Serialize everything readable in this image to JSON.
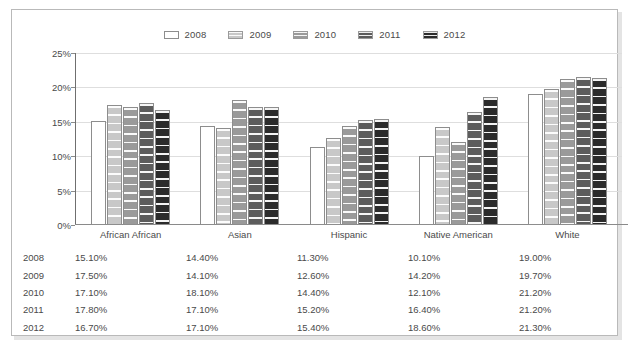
{
  "chart_data": {
    "type": "bar",
    "title": "",
    "subtitle": "",
    "xlabel": "",
    "ylabel": "",
    "ylim": [
      0,
      25
    ],
    "ytick_labels": [
      "0%",
      "5%",
      "10%",
      "15%",
      "20%",
      "25%"
    ],
    "ytick_values": [
      0,
      5,
      10,
      15,
      20,
      25
    ],
    "grid": true,
    "legend_position": "top-center",
    "value_suffix": "%",
    "categories": [
      "African African",
      "Asian",
      "Hispanic",
      "Native American",
      "White"
    ],
    "series": [
      {
        "name": "2008",
        "color": "#ffffff",
        "values": [
          15.1,
          14.4,
          11.3,
          10.1,
          19.0
        ]
      },
      {
        "name": "2009",
        "color": "#c8c8c8",
        "values": [
          17.5,
          14.1,
          12.6,
          14.2,
          19.7
        ]
      },
      {
        "name": "2010",
        "color": "#9a9a9a",
        "values": [
          17.1,
          18.1,
          14.4,
          12.1,
          21.2
        ]
      },
      {
        "name": "2011",
        "color": "#5c5c5c",
        "values": [
          17.8,
          17.1,
          15.2,
          16.4,
          21.5
        ]
      },
      {
        "name": "2012",
        "color": "#2b2b2b",
        "values": [
          16.7,
          17.1,
          15.4,
          18.6,
          21.3
        ]
      }
    ]
  },
  "legend": {
    "items": [
      {
        "label": "2008"
      },
      {
        "label": "2009"
      },
      {
        "label": "2010"
      },
      {
        "label": "2011"
      },
      {
        "label": "2012"
      }
    ]
  },
  "table": {
    "row_labels": [
      "2008",
      "2009",
      "2010",
      "2011",
      "2012"
    ],
    "column_headers": [
      "",
      "African African",
      "Asian",
      "Hispanic",
      "Native American",
      "White"
    ],
    "rows": [
      {
        "year": "2008",
        "values": [
          "15.10%",
          "14.40%",
          "11.30%",
          "10.10%",
          "19.00%"
        ]
      },
      {
        "year": "2009",
        "values": [
          "17.50%",
          "14.10%",
          "12.60%",
          "14.20%",
          "19.70%"
        ]
      },
      {
        "year": "2010",
        "values": [
          "17.10%",
          "18.10%",
          "14.40%",
          "12.10%",
          "21.20%"
        ]
      },
      {
        "year": "2011",
        "values": [
          "17.80%",
          "17.10%",
          "15.20%",
          "16.40%",
          "21.20%"
        ]
      },
      {
        "year": "2012",
        "values": [
          "16.70%",
          "17.10%",
          "15.40%",
          "18.60%",
          "21.30%"
        ]
      }
    ]
  },
  "style": {
    "page_background": "#ffffff",
    "card_border": "#b9b9b9",
    "axis_color": "#6f6f6f",
    "grid_color": "#dedede",
    "text_color": "#4a4a4a"
  }
}
